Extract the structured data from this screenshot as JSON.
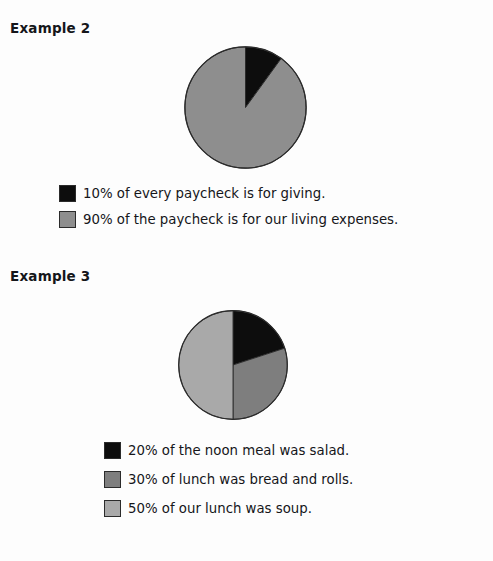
{
  "colors": {
    "black": "#0d0d0d",
    "dark_gray": "#7e7e7e",
    "light_gray": "#a9a9a9",
    "mid_gray": "#8e8e8e",
    "outline": "#2b2b2b",
    "background": "#fdfdfd",
    "text": "#15161a"
  },
  "examples": [
    {
      "heading": "Example 2",
      "legend": [
        {
          "swatch": "#0d0d0d",
          "label": "10% of every paycheck is for giving."
        },
        {
          "swatch": "#8e8e8e",
          "label": "90% of the paycheck is for our living expenses."
        }
      ]
    },
    {
      "heading": "Example 3",
      "legend": [
        {
          "swatch": "#0d0d0d",
          "label": "20% of the noon meal was salad."
        },
        {
          "swatch": "#7e7e7e",
          "label": "30% of lunch was bread and rolls."
        },
        {
          "swatch": "#a9a9a9",
          "label": "50% of our lunch was soup."
        }
      ]
    }
  ],
  "chart_data": [
    {
      "type": "pie",
      "title": "Example 2",
      "categories": [
        "giving",
        "living expenses"
      ],
      "values": [
        10,
        90
      ],
      "labels": [
        "10% of every paycheck is for giving.",
        "90% of the paycheck is for our living expenses."
      ],
      "colors": [
        "#0d0d0d",
        "#8e8e8e"
      ],
      "start_angle_deg": 0,
      "direction": "clockwise",
      "units": "percent",
      "legend_position": "below"
    },
    {
      "type": "pie",
      "title": "Example 3",
      "categories": [
        "salad",
        "bread and rolls",
        "soup"
      ],
      "values": [
        20,
        30,
        50
      ],
      "labels": [
        "20% of the noon meal was salad.",
        "30% of lunch was bread and rolls.",
        "50% of our lunch was soup."
      ],
      "colors": [
        "#0d0d0d",
        "#7e7e7e",
        "#a9a9a9"
      ],
      "start_angle_deg": 0,
      "direction": "clockwise",
      "units": "percent",
      "legend_position": "below"
    }
  ]
}
